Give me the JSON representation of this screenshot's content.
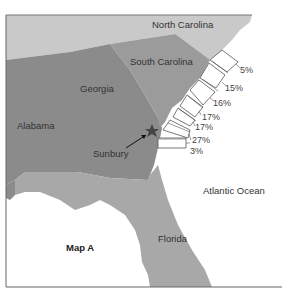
{
  "map": {
    "title": "Map A",
    "regions": [
      {
        "name": "North Carolina",
        "color": "#c9c9c9"
      },
      {
        "name": "South Carolina",
        "color": "#9b9b9b"
      },
      {
        "name": "Georgia",
        "color": "#8b8b8b"
      },
      {
        "name": "Alabama",
        "color": "#8b8b8b"
      },
      {
        "name": "Florida",
        "color": "#a8a8a8"
      }
    ],
    "ocean_label": "Atlantic Ocean",
    "marker": {
      "label": "Sunbury",
      "icon": "star-icon"
    },
    "coastal_segments": [
      {
        "value": "5%"
      },
      {
        "value": "15%"
      },
      {
        "value": "16%"
      },
      {
        "value": "17%"
      },
      {
        "value": "17%"
      },
      {
        "value": "27%"
      },
      {
        "value": "3%"
      }
    ]
  }
}
